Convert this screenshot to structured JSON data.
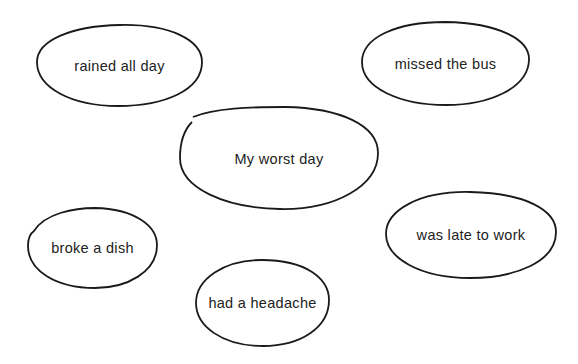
{
  "diagram": {
    "type": "bubble-map",
    "center": {
      "label": "My worst day"
    },
    "nodes": [
      {
        "label": "rained all day"
      },
      {
        "label": "missed the bus"
      },
      {
        "label": "broke a dish"
      },
      {
        "label": "was late to work"
      },
      {
        "label": "had a headache"
      }
    ],
    "stroke_color": "#1a1a1a",
    "text_color": "#222222"
  }
}
